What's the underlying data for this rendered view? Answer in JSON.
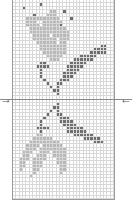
{
  "chart": {
    "columns": 30,
    "rows": 58,
    "legend": {
      ".": "empty",
      "L": "light-gray",
      "D": "dark-gray"
    },
    "colors": {
      "light": "#b8b8b8",
      "dark": "#6e6e6e",
      "grid": "#d8d8d8"
    },
    "pattern": [
      "..............................",
      "........D.....................",
      "...D..........................",
      "...........LL..D..............",
      "......D...LLL.................",
      "....LLLLLLLLLL...D............",
      "....LLL..LLLLLL...............",
      "....LLLL.LLLLLD...............",
      ".....LLLLLLLLLLL..............",
      ".....LLLLLLLLLLLL.............",
      "......LLLLL.LLLLL.............",
      "......LLLLLLL.LLL.............",
      ".......LLLLLL.LL..............",
      "........LLLLLLLL..........DD..",
      "........LLLLLLLL........DDDD..",
      ".........LLLLLLL.......DDDDD..",
      "..........LLLLL.....DDDDD.....",
      "...........LLL....DDDDDD......",
      "........DD.......DDDDD........",
      ".......DDDD.....DDDDD.........",
      "........D.......DDDD..........",
      "........D......DDDD...........",
      "........D......DDD............",
      ".........D....DDD.............",
      "..........D..DD...............",
      "...........D.D................",
      "............DD................",
      ".............D................",
      "..............................",
      "..............................",
      ".............D................",
      "............DD................",
      "...........D.D................",
      "..........D..DD...............",
      ".........D....DDD.............",
      "........D.....DDDD............",
      "........D......DDDD...........",
      ".......DDDD.....DDDDD.........",
      "........D.......DDDDDD........",
      ".......LL.........DDDDDD......",
      "......LLLLLL.........DDDDD....",
      ".....LLLLLLLLL..........DDD...",
      "....LLLL.LLLLLL...............",
      "....LLL.LLLLLLLL..............",
      "...LLL..LLL.LLLL..............",
      "...LL..LLL..LLLL..............",
      "..LLL.LLLL...LLL..............",
      "..LL..LLL....LLL..............",
      "..LL..LLL.....LL..............",
      "..L...LL......LL..............",
      "......L.......L...............",
      ".....L........................",
      "..............................",
      "..............................",
      "..............................",
      "..............................",
      "..............................",
      ".............................."
    ]
  },
  "markers": {
    "left_arrow": "→",
    "right_arrow": "←"
  }
}
